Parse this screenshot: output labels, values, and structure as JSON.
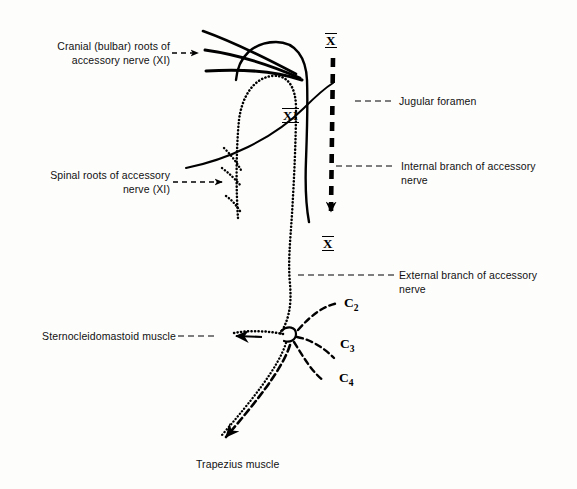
{
  "figure": {
    "background_color": "#fdfdfc",
    "ink_color": "#000000",
    "width": 577,
    "height": 489
  },
  "labels": {
    "cranial_roots": "Cranial (bulbar) roots of\naccessory nerve (XI)",
    "spinal_roots": "Spinal roots of accessory\nnerve (XI)",
    "jugular_foramen": "Jugular foramen",
    "internal_branch": "Internal branch of accessory\nnerve",
    "external_branch": "External branch of accessory\nnerve",
    "sternocleidomastoid": "Sternocleidomastoid muscle",
    "trapezius": "Trapezius muscle"
  },
  "markers": {
    "vagus_top": "X",
    "vagus_bottom": "X",
    "accessory": "XI"
  },
  "cervical_roots": [
    {
      "letter": "C",
      "number": "2"
    },
    {
      "letter": "C",
      "number": "3"
    },
    {
      "letter": "C",
      "number": "4"
    }
  ]
}
